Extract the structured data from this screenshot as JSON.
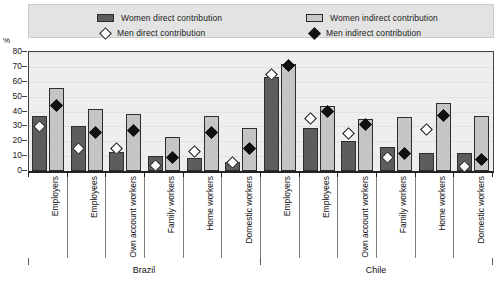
{
  "axis": {
    "unit_label": "%",
    "y_ticks": [
      0,
      10,
      20,
      30,
      40,
      50,
      60,
      70,
      80
    ]
  },
  "legend": {
    "women_direct": "Women direct contribution",
    "women_indirect": "Women indirect contribution",
    "men_direct": "Men direct contribution",
    "men_indirect": "Men indirect contribution"
  },
  "countries": [
    {
      "name": "Brazil"
    },
    {
      "name": "Chile"
    }
  ],
  "chart_data": {
    "type": "bar",
    "title": "",
    "xlabel": "",
    "ylabel": "%",
    "ylim": [
      0,
      80
    ],
    "grid": true,
    "legend_position": "top",
    "categories": [
      "Employers",
      "Employees",
      "Own account workers",
      "Family workers",
      "Home workers",
      "Domestic workers",
      "Employers",
      "Employees",
      "Own account workers",
      "Family workers",
      "Home workers",
      "Domestic workers"
    ],
    "groups": [
      "Brazil",
      "Brazil",
      "Brazil",
      "Brazil",
      "Brazil",
      "Brazil",
      "Chile",
      "Chile",
      "Chile",
      "Chile",
      "Chile",
      "Chile"
    ],
    "series": [
      {
        "name": "Women direct contribution",
        "kind": "bar",
        "color": "#5d5d5d",
        "values": [
          37,
          30,
          13,
          10,
          9,
          6,
          63,
          29,
          20,
          16,
          12,
          12
        ]
      },
      {
        "name": "Women indirect contribution",
        "kind": "bar",
        "color": "#c5c5c5",
        "values": [
          56,
          42,
          38,
          23,
          37,
          29,
          72,
          44,
          35,
          36,
          46,
          37
        ]
      },
      {
        "name": "Men direct contribution",
        "kind": "marker-open-diamond",
        "color": "#ffffff",
        "values": [
          30,
          15,
          15,
          4,
          13,
          6,
          65,
          35,
          25,
          9,
          28,
          3
        ]
      },
      {
        "name": "Men indirect contribution",
        "kind": "marker-solid-diamond",
        "color": "#111111",
        "values": [
          44,
          26,
          27,
          9,
          26,
          15,
          71,
          40,
          31,
          12,
          37,
          8
        ]
      }
    ]
  }
}
